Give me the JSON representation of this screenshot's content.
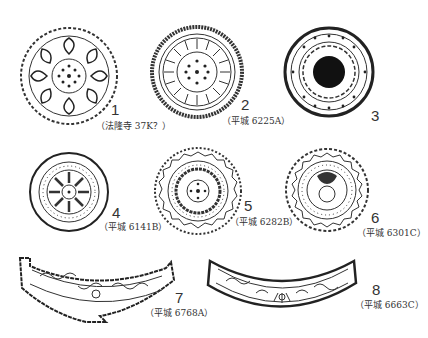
{
  "figures": [
    {
      "number": "1",
      "caption": "（法隆寺 37K？）",
      "type": "round-tile",
      "pattern": "lotus-petal"
    },
    {
      "number": "2",
      "caption": "（平城 6225A）",
      "type": "round-tile",
      "pattern": "fine-petal-lotus"
    },
    {
      "number": "3",
      "caption": "",
      "type": "round-tile",
      "pattern": "dark-center-scroll"
    },
    {
      "number": "4",
      "caption": "（平城 6141B）",
      "type": "round-tile",
      "pattern": "radial-petal"
    },
    {
      "number": "5",
      "caption": "（平城 6282B）",
      "type": "round-tile",
      "pattern": "zigzag-border-lotus"
    },
    {
      "number": "6",
      "caption": "（平城 6301C）",
      "type": "round-tile",
      "pattern": "zigzag-border-flower"
    },
    {
      "number": "7",
      "caption": "（平城 6768A）",
      "type": "eave-tile",
      "pattern": "arabesque-scroll"
    },
    {
      "number": "8",
      "caption": "（平城 6663C）",
      "type": "eave-tile",
      "pattern": "arabesque-scroll"
    }
  ],
  "colors": {
    "ink": "#222222",
    "paper": "#ffffff"
  }
}
